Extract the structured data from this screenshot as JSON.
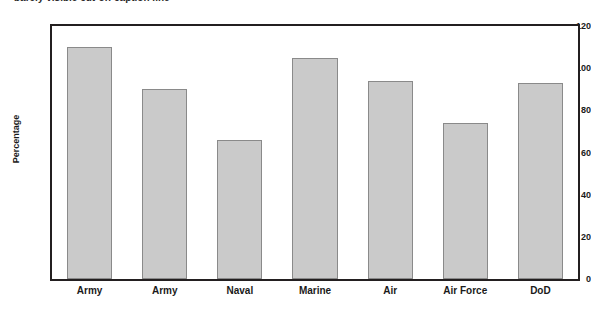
{
  "caption": {
    "text": "barely visible cut-off caption line"
  },
  "chart_data": {
    "type": "bar",
    "title": "",
    "xlabel": "",
    "ylabel": "Percentage",
    "categories": [
      "Army",
      "Army",
      "Naval",
      "Marine",
      "Air",
      "Air Force",
      "DoD"
    ],
    "values": [
      110,
      90,
      66,
      105,
      94,
      74,
      93
    ],
    "ylim": [
      0,
      120
    ],
    "yticks": [
      0,
      20,
      40,
      60,
      80,
      100,
      120
    ],
    "ytick_labels": [
      "0",
      "20",
      "40",
      "60",
      "80",
      "100",
      "120"
    ],
    "grid": false,
    "legend": null,
    "bar_color": "#cacaca",
    "bar_edge_color": "#8a8a8a",
    "axis_color": "#231f20"
  }
}
